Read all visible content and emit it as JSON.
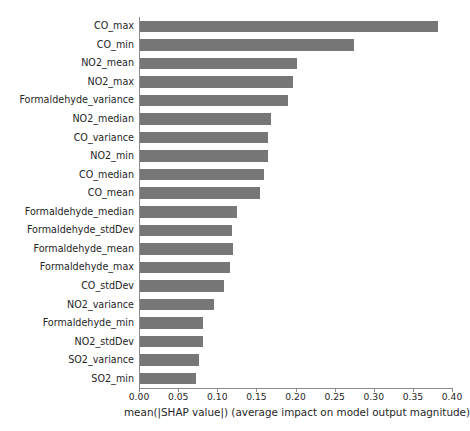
{
  "chart_data": {
    "type": "bar",
    "orientation": "horizontal",
    "title": "",
    "xlabel": "mean(|SHAP value|) (average impact on model output magnitude)",
    "ylabel": "",
    "xlim": [
      0.0,
      0.4
    ],
    "xticks": [
      0.0,
      0.05,
      0.1,
      0.15,
      0.2,
      0.25,
      0.3,
      0.35,
      0.4
    ],
    "xticklabels": [
      "0.00",
      "0.05",
      "0.10",
      "0.15",
      "0.20",
      "0.25",
      "0.30",
      "0.35",
      "0.40"
    ],
    "grid": false,
    "legend": null,
    "bar_color": "#777777",
    "categories": [
      "CO_max",
      "CO_min",
      "NO2_mean",
      "NO2_max",
      "Formaldehyde_variance",
      "NO2_median",
      "CO_variance",
      "NO2_min",
      "CO_median",
      "CO_mean",
      "Formaldehyde_median",
      "Formaldehyde_stdDev",
      "Formaldehyde_mean",
      "Formaldehyde_max",
      "CO_stdDev",
      "NO2_variance",
      "Formaldehyde_min",
      "NO2_stdDev",
      "SO2_variance",
      "SO2_min"
    ],
    "values": [
      0.381,
      0.274,
      0.201,
      0.196,
      0.189,
      0.168,
      0.163,
      0.163,
      0.159,
      0.153,
      0.124,
      0.118,
      0.119,
      0.115,
      0.107,
      0.094,
      0.081,
      0.08,
      0.076,
      0.072
    ]
  },
  "axis": {
    "x_caption": "mean(|SHAP value|) (average impact on model output magnitude)"
  }
}
